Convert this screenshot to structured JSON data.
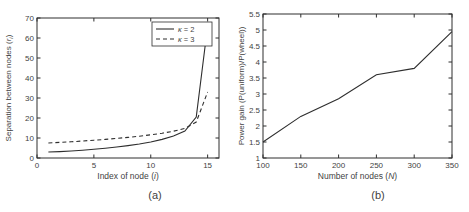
{
  "page": {
    "background": "#ffffff",
    "text_color": "#3f3f3f",
    "line_color": "#2e2e2e"
  },
  "chart_data": [
    {
      "type": "line",
      "caption": "(a)",
      "xlabel_parts": [
        {
          "text": "Index of node ("
        },
        {
          "text": "i",
          "italic": true
        },
        {
          "text": ")"
        }
      ],
      "ylabel_parts": [
        {
          "text": "Separation between nodes ("
        },
        {
          "text": "r",
          "italic": true
        },
        {
          "text": "i",
          "sub": true,
          "italic": true
        },
        {
          "text": ")"
        }
      ],
      "xlim": [
        0,
        16
      ],
      "ylim": [
        0,
        70
      ],
      "xticks": [
        {
          "v": 0,
          "label": "0"
        },
        {
          "v": 5,
          "label": "5"
        },
        {
          "v": 10,
          "label": "10"
        },
        {
          "v": 15,
          "label": "15"
        }
      ],
      "yticks": [
        {
          "v": 0,
          "label": "0"
        },
        {
          "v": 10,
          "label": "10"
        },
        {
          "v": 20,
          "label": "20"
        },
        {
          "v": 30,
          "label": "30"
        },
        {
          "v": 40,
          "label": "40"
        },
        {
          "v": 50,
          "label": "50"
        },
        {
          "v": 60,
          "label": "60"
        },
        {
          "v": 70,
          "label": "70"
        }
      ],
      "legend": {
        "position": "top-right"
      },
      "series": [
        {
          "name_parts": [
            {
              "text": "κ",
              "italic": true
            },
            {
              "text": " = 2"
            }
          ],
          "dash": null,
          "points": [
            [
              1,
              3
            ],
            [
              2,
              3.2
            ],
            [
              3,
              3.5
            ],
            [
              4,
              3.9
            ],
            [
              5,
              4.4
            ],
            [
              6,
              4.9
            ],
            [
              7,
              5.5
            ],
            [
              8,
              6.2
            ],
            [
              9,
              7.0
            ],
            [
              10,
              8.0
            ],
            [
              11,
              9.3
            ],
            [
              12,
              11.0
            ],
            [
              13,
              13.5
            ],
            [
              14,
              20.5
            ],
            [
              15,
              66
            ]
          ]
        },
        {
          "name_parts": [
            {
              "text": "κ",
              "italic": true
            },
            {
              "text": " = 3"
            }
          ],
          "dash": "4,3",
          "points": [
            [
              1,
              7.5
            ],
            [
              2,
              7.8
            ],
            [
              3,
              8.1
            ],
            [
              4,
              8.5
            ],
            [
              5,
              8.9
            ],
            [
              6,
              9.3
            ],
            [
              7,
              9.8
            ],
            [
              8,
              10.3
            ],
            [
              9,
              10.9
            ],
            [
              10,
              11.6
            ],
            [
              11,
              12.4
            ],
            [
              12,
              13.4
            ],
            [
              13,
              14.8
            ],
            [
              14,
              18
            ],
            [
              15,
              33
            ]
          ]
        }
      ]
    },
    {
      "type": "line",
      "caption": "(b)",
      "xlabel_parts": [
        {
          "text": "Number of nodes ("
        },
        {
          "text": "N",
          "italic": true
        },
        {
          "text": ")"
        }
      ],
      "ylabel_parts": [
        {
          "text": "Power gain (P(uniform)/P(wheel))"
        }
      ],
      "xlim": [
        100,
        350
      ],
      "ylim": [
        1,
        5.5
      ],
      "xticks": [
        {
          "v": 100,
          "label": "100"
        },
        {
          "v": 150,
          "label": "150"
        },
        {
          "v": 200,
          "label": "200"
        },
        {
          "v": 250,
          "label": "250"
        },
        {
          "v": 300,
          "label": "300"
        },
        {
          "v": 350,
          "label": "350"
        }
      ],
      "yticks": [
        {
          "v": 1,
          "label": "1"
        },
        {
          "v": 1.5,
          "label": "1.5"
        },
        {
          "v": 2,
          "label": "2"
        },
        {
          "v": 2.5,
          "label": "2.5"
        },
        {
          "v": 3,
          "label": "3"
        },
        {
          "v": 3.5,
          "label": "3.5"
        },
        {
          "v": 4,
          "label": "4"
        },
        {
          "v": 4.5,
          "label": "4.5"
        },
        {
          "v": 5,
          "label": "5"
        },
        {
          "v": 5.5,
          "label": "5.5"
        }
      ],
      "series": [
        {
          "name_parts": [
            {
              "text": "P(uniform)/P(wheel)"
            }
          ],
          "dash": null,
          "points": [
            [
              100,
              1.5
            ],
            [
              150,
              2.3
            ],
            [
              200,
              2.85
            ],
            [
              250,
              3.6
            ],
            [
              300,
              3.8
            ],
            [
              350,
              4.95
            ]
          ]
        }
      ]
    }
  ]
}
